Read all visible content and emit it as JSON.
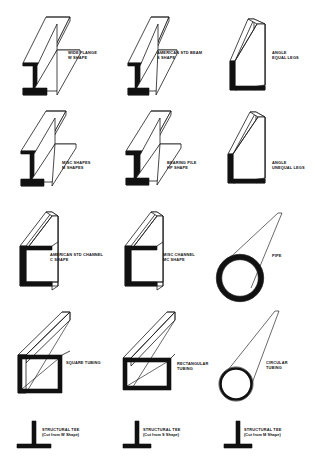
{
  "document": {
    "title": "Structural Steel Shapes Reference Chart",
    "background_color": "#ffffff",
    "line_color": "#1a1a1a",
    "fill_color": "#111111"
  },
  "rows": [
    {
      "row_index": 1,
      "items": [
        {
          "shape_id": "wide-flange-w-shape",
          "shape_type": "i-beam",
          "line1": "WIDE FLANGE",
          "line2": "W SHAPE"
        },
        {
          "shape_id": "american-std-beam-s-shape",
          "shape_type": "i-beam-tapered",
          "line1": "AMERICAN STD BEAM",
          "line2": "S SHAPE"
        },
        {
          "shape_id": "angle-equal-legs",
          "shape_type": "angle",
          "line1": "ANGLE",
          "line2": "EQUAL LEGS"
        }
      ]
    },
    {
      "row_index": 2,
      "items": [
        {
          "shape_id": "misc-shapes-m-shapes",
          "shape_type": "i-beam",
          "line1": "MISC SHAPES",
          "line2": "M SHAPES"
        },
        {
          "shape_id": "bearing-pile-hp-shape",
          "shape_type": "i-beam",
          "line1": "BEARING PILE",
          "line2": "HP SHAPE"
        },
        {
          "shape_id": "angle-unequal-legs",
          "shape_type": "angle",
          "line1": "ANGLE",
          "line2": "UNEQUAL LEGS"
        }
      ]
    },
    {
      "row_index": 3,
      "items": [
        {
          "shape_id": "american-std-channel-c-shape",
          "shape_type": "channel",
          "line1": "AMERICAN STD CHANNEL",
          "line2": "C SHAPE"
        },
        {
          "shape_id": "misc-channel-mc-shape",
          "shape_type": "channel",
          "line1": "MISC CHANNEL",
          "line2": "MC SHAPE"
        },
        {
          "shape_id": "pipe",
          "shape_type": "round-thick-wall",
          "line1": "PIPE",
          "line2": ""
        }
      ]
    },
    {
      "row_index": 4,
      "items": [
        {
          "shape_id": "square-tubing",
          "shape_type": "square-tube",
          "line1": "SQUARE TUBING",
          "line2": ""
        },
        {
          "shape_id": "rectangular-tubing",
          "shape_type": "rect-tube",
          "line1": "RECTANGULAR",
          "line2": "TUBING"
        },
        {
          "shape_id": "circular-tubing",
          "shape_type": "round-thin-wall",
          "line1": "CIRCULAR",
          "line2": "TUBING"
        }
      ]
    },
    {
      "row_index": 5,
      "items": [
        {
          "shape_id": "structural-tee-from-w",
          "shape_type": "tee",
          "line1": "STRUCTURAL TEE",
          "line2": "(Cut from W Shape)"
        },
        {
          "shape_id": "structural-tee-from-s",
          "shape_type": "tee",
          "line1": "STRUCTURAL TEE",
          "line2": "(Cut from S Shape)"
        },
        {
          "shape_id": "structural-tee-from-m",
          "shape_type": "tee",
          "line1": "STRUCTURAL TEE",
          "line2": "(Cut from M Shape)"
        }
      ]
    }
  ]
}
